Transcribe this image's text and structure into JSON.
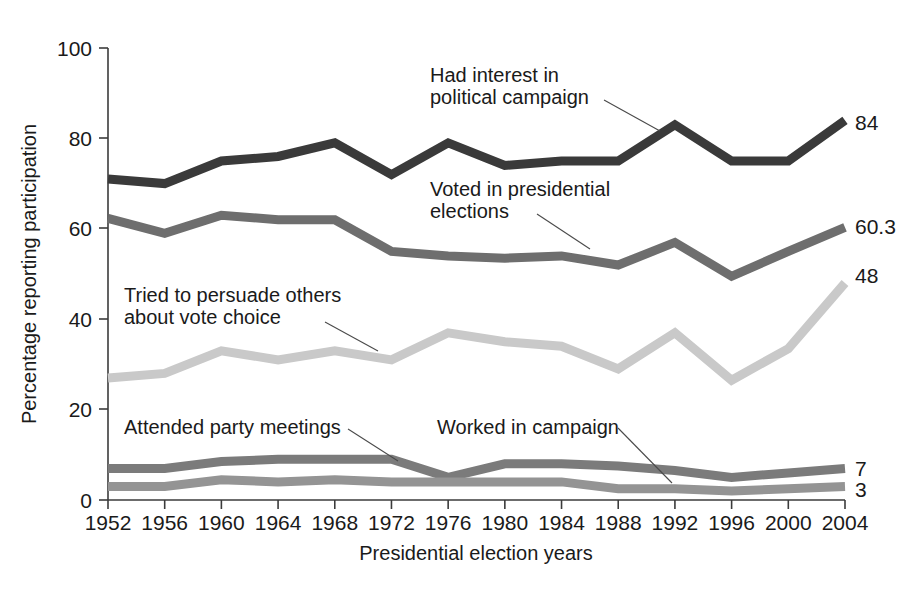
{
  "chart_data": {
    "type": "line",
    "title": "",
    "xlabel": "Presidential election years",
    "ylabel": "Percentage reporting participation",
    "categories": [
      "1952",
      "1956",
      "1960",
      "1964",
      "1968",
      "1972",
      "1976",
      "1980",
      "1984",
      "1988",
      "1992",
      "1996",
      "2000",
      "2004"
    ],
    "x": [
      1952,
      1956,
      1960,
      1964,
      1968,
      1972,
      1976,
      1980,
      1984,
      1988,
      1992,
      1996,
      2000,
      2004
    ],
    "xlim": [
      1952,
      2004
    ],
    "ylim": [
      0,
      100
    ],
    "yticks": [
      0,
      20,
      40,
      60,
      80,
      100
    ],
    "ytick_labels": [
      "0",
      "20",
      "40",
      "60",
      "80",
      "100"
    ],
    "grid": false,
    "legend_position": "inline-annotations",
    "series": [
      {
        "name": "Had interest in political campaign",
        "color": "#3a3a3a",
        "end_value_label": "84",
        "values": [
          71,
          70,
          75,
          76,
          79,
          72,
          79,
          74,
          75,
          75,
          83,
          75,
          75,
          84
        ]
      },
      {
        "name": "Voted in presidential elections",
        "color": "#6e6e6e",
        "end_value_label": "60.3",
        "values": [
          62.3,
          59,
          63,
          62,
          62,
          55,
          54,
          53.5,
          54,
          52,
          57,
          49.5,
          55,
          60.3
        ]
      },
      {
        "name": "Tried to persuade others about vote choice",
        "color": "#c9c9c9",
        "end_value_label": "48",
        "values": [
          27,
          28,
          33,
          31,
          33,
          31,
          37,
          35,
          34,
          29,
          37,
          26.5,
          33.5,
          48
        ]
      },
      {
        "name": "Attended party meetings",
        "color": "#7b7b7b",
        "end_value_label": "7",
        "values": [
          7,
          7,
          8.5,
          9,
          9,
          9,
          5,
          8,
          8,
          7.5,
          6.5,
          5,
          6,
          7
        ]
      },
      {
        "name": "Worked in campaign",
        "color": "#949494",
        "end_value_label": "3",
        "values": [
          3,
          3,
          4.5,
          4,
          4.5,
          4,
          4,
          4,
          4,
          2.5,
          2.5,
          2,
          2.5,
          3
        ]
      }
    ],
    "annotations": [
      {
        "id": "ann-interest",
        "text_line1": "Had interest in",
        "text_line2": "political campaign"
      },
      {
        "id": "ann-voted",
        "text_line1": "Voted in presidential",
        "text_line2": "elections"
      },
      {
        "id": "ann-persuade",
        "text_line1": "Tried to persuade others",
        "text_line2": "about vote choice"
      },
      {
        "id": "ann-meetings",
        "text_line1": "Attended party meetings",
        "text_line2": ""
      },
      {
        "id": "ann-worked",
        "text_line1": "Worked in campaign",
        "text_line2": ""
      }
    ]
  }
}
